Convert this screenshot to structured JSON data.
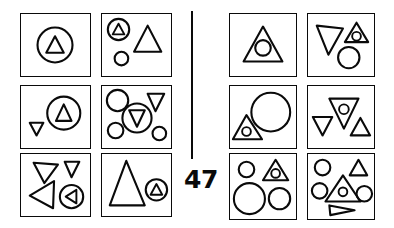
{
  "figure": {
    "page_number": "47",
    "ink_color": "#0a0a0a",
    "background_color": "#ffffff",
    "divider": "vertical-rule",
    "layout": "two blocks of 2 columns x 3 rows of framed panels separated by a vertical rule"
  },
  "panels": [
    {
      "id": "left-r1c1",
      "block": "left",
      "row": 1,
      "column": 1,
      "label": "circle containing small up-triangle",
      "shapes": [
        {
          "name": "circle-with-up-triangle",
          "kind": "circle",
          "contains": "up-triangle",
          "size": "medium",
          "position": "center"
        }
      ]
    },
    {
      "id": "left-r1c2",
      "block": "left",
      "row": 1,
      "column": 2,
      "label": "circle containing up-triangle, large up-triangle and small circle",
      "shapes": [
        {
          "name": "circle-with-up-triangle",
          "kind": "circle",
          "contains": "up-triangle",
          "size": "small",
          "position": "top-left"
        },
        {
          "name": "up-triangle",
          "kind": "triangle",
          "contains": null,
          "size": "large",
          "position": "right"
        },
        {
          "name": "circle",
          "kind": "circle",
          "contains": null,
          "size": "small",
          "position": "bottom-left"
        }
      ]
    },
    {
      "id": "left-r2c1",
      "block": "left",
      "row": 2,
      "column": 1,
      "label": "small down-triangle and circle containing up-triangle",
      "shapes": [
        {
          "name": "down-triangle",
          "kind": "triangle",
          "contains": null,
          "size": "small",
          "position": "left"
        },
        {
          "name": "circle-with-up-triangle",
          "kind": "circle",
          "contains": "up-triangle",
          "size": "medium",
          "position": "right"
        }
      ]
    },
    {
      "id": "left-r2c2",
      "block": "left",
      "row": 2,
      "column": 2,
      "label": "three circles, a down-triangle and a circle containing a down-triangle",
      "shapes": [
        {
          "name": "circle",
          "kind": "circle",
          "contains": null,
          "size": "medium",
          "position": "top-left"
        },
        {
          "name": "down-triangle",
          "kind": "triangle",
          "contains": null,
          "size": "small",
          "position": "top-right"
        },
        {
          "name": "circle-with-down-triangle",
          "kind": "circle",
          "contains": "down-triangle",
          "size": "medium",
          "position": "center"
        },
        {
          "name": "circle",
          "kind": "circle",
          "contains": null,
          "size": "small",
          "position": "bottom-left"
        },
        {
          "name": "circle",
          "kind": "circle",
          "contains": null,
          "size": "small",
          "position": "bottom-right"
        }
      ]
    },
    {
      "id": "left-r3c1",
      "block": "left",
      "row": 3,
      "column": 1,
      "label": "two down-triangles, a left-triangle and a circle containing a left-triangle",
      "shapes": [
        {
          "name": "down-triangle",
          "kind": "triangle",
          "contains": null,
          "size": "medium",
          "position": "top-left"
        },
        {
          "name": "down-triangle",
          "kind": "triangle",
          "contains": null,
          "size": "small",
          "position": "top-right"
        },
        {
          "name": "left-triangle",
          "kind": "triangle",
          "contains": null,
          "size": "medium",
          "position": "bottom-left"
        },
        {
          "name": "circle-with-left-triangle",
          "kind": "circle",
          "contains": "left-triangle",
          "size": "small",
          "position": "bottom-right"
        }
      ]
    },
    {
      "id": "left-r3c2",
      "block": "left",
      "row": 3,
      "column": 2,
      "label": "large up-triangle and circle containing small up-triangle",
      "shapes": [
        {
          "name": "up-triangle",
          "kind": "triangle",
          "contains": null,
          "size": "large",
          "position": "left"
        },
        {
          "name": "circle-with-up-triangle",
          "kind": "circle",
          "contains": "up-triangle",
          "size": "small",
          "position": "right"
        }
      ]
    },
    {
      "id": "right-r1c1",
      "block": "right",
      "row": 1,
      "column": 1,
      "label": "up-triangle containing a circle",
      "shapes": [
        {
          "name": "up-triangle-with-circle",
          "kind": "triangle",
          "contains": "circle",
          "size": "large",
          "position": "center"
        }
      ]
    },
    {
      "id": "right-r1c2",
      "block": "right",
      "row": 1,
      "column": 2,
      "label": "down-triangle, small up-triangle containing a circle, and a circle",
      "shapes": [
        {
          "name": "down-triangle",
          "kind": "triangle",
          "contains": null,
          "size": "medium",
          "position": "left"
        },
        {
          "name": "up-triangle-with-circle",
          "kind": "triangle",
          "contains": "circle",
          "size": "small",
          "position": "top-right"
        },
        {
          "name": "circle",
          "kind": "circle",
          "contains": null,
          "size": "medium",
          "position": "bottom-right"
        }
      ]
    },
    {
      "id": "right-r2c1",
      "block": "right",
      "row": 2,
      "column": 1,
      "label": "up-triangle containing a circle and a large circle",
      "shapes": [
        {
          "name": "up-triangle-with-circle",
          "kind": "triangle",
          "contains": "circle",
          "size": "small",
          "position": "bottom-left"
        },
        {
          "name": "circle",
          "kind": "circle",
          "contains": null,
          "size": "large",
          "position": "right"
        }
      ]
    },
    {
      "id": "right-r2c2",
      "block": "right",
      "row": 2,
      "column": 2,
      "label": "down-triangle, down-triangle containing a circle, and an up-triangle",
      "shapes": [
        {
          "name": "down-triangle",
          "kind": "triangle",
          "contains": null,
          "size": "small",
          "position": "left"
        },
        {
          "name": "down-triangle-with-circle",
          "kind": "triangle",
          "contains": "circle",
          "size": "medium",
          "position": "center"
        },
        {
          "name": "up-triangle",
          "kind": "triangle",
          "contains": null,
          "size": "small",
          "position": "bottom-right"
        }
      ]
    },
    {
      "id": "right-r3c1",
      "block": "right",
      "row": 3,
      "column": 1,
      "label": "small circle, up-triangle containing a circle, large circle and medium circle",
      "shapes": [
        {
          "name": "circle",
          "kind": "circle",
          "contains": null,
          "size": "small",
          "position": "top-left"
        },
        {
          "name": "up-triangle-with-circle",
          "kind": "triangle",
          "contains": "circle",
          "size": "small",
          "position": "top-right"
        },
        {
          "name": "circle",
          "kind": "circle",
          "contains": null,
          "size": "large",
          "position": "bottom-left"
        },
        {
          "name": "circle",
          "kind": "circle",
          "contains": null,
          "size": "medium",
          "position": "bottom-right"
        }
      ]
    },
    {
      "id": "right-r3c2",
      "block": "right",
      "row": 3,
      "column": 2,
      "label": "three circles, an up-triangle, an up-triangle containing a circle and a right-triangle",
      "shapes": [
        {
          "name": "circle",
          "kind": "circle",
          "contains": null,
          "size": "small",
          "position": "top-left"
        },
        {
          "name": "up-triangle",
          "kind": "triangle",
          "contains": null,
          "size": "small",
          "position": "top-right"
        },
        {
          "name": "circle",
          "kind": "circle",
          "contains": null,
          "size": "small",
          "position": "left"
        },
        {
          "name": "up-triangle-with-circle",
          "kind": "triangle",
          "contains": "circle",
          "size": "medium",
          "position": "center"
        },
        {
          "name": "circle",
          "kind": "circle",
          "contains": null,
          "size": "small",
          "position": "right"
        },
        {
          "name": "right-triangle",
          "kind": "triangle",
          "contains": null,
          "size": "small",
          "position": "bottom-center"
        }
      ]
    }
  ]
}
